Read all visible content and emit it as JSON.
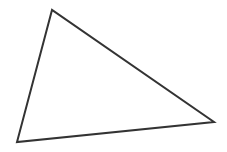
{
  "diagram": {
    "shape": "triangle",
    "vertices": {
      "top": [
        52,
        10
      ],
      "bottom_left": [
        17,
        142
      ],
      "right": [
        214,
        122
      ]
    },
    "stroke_color": "#333333",
    "stroke_width": 2,
    "fill_color": "#ffffff"
  }
}
